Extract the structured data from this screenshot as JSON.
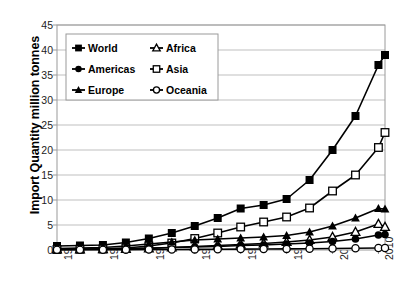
{
  "chart_data": {
    "type": "line",
    "title": "",
    "xlabel": "",
    "ylabel": "Import Quantity million tonnes",
    "xlim": [
      1961,
      2011
    ],
    "ylim": [
      0,
      45
    ],
    "ytick_labels": [
      "0",
      "5",
      "10",
      "15",
      "20",
      "25",
      "30",
      "35",
      "40",
      "45"
    ],
    "ytick_values": [
      0,
      5,
      10,
      15,
      20,
      25,
      30,
      35,
      40,
      45
    ],
    "xtick_labels": [
      "1961",
      "1968",
      "1975",
      "1982",
      "1989",
      "1996",
      "2003",
      "2010"
    ],
    "xtick_values": [
      1961,
      1968,
      1975,
      1982,
      1989,
      1996,
      2003,
      2010
    ],
    "grid": "horizontal",
    "legend_position": "top-left-inside",
    "x": [
      1961,
      1964.5,
      1968,
      1971.5,
      1975,
      1978.5,
      1982,
      1985.5,
      1989,
      1992.5,
      1996,
      1999.5,
      2003,
      2006.5,
      2010,
      2011
    ],
    "series": [
      {
        "name": "World",
        "marker": "filled-square",
        "values": [
          0.8,
          0.9,
          1.0,
          1.5,
          2.3,
          3.4,
          4.8,
          6.4,
          8.3,
          9.0,
          10.2,
          14.0,
          20.0,
          26.8,
          37.0,
          39.0
        ]
      },
      {
        "name": "Africa",
        "marker": "open-triangle",
        "values": [
          0.1,
          0.1,
          0.15,
          0.2,
          0.3,
          0.5,
          0.7,
          0.9,
          1.1,
          1.3,
          1.6,
          2.0,
          2.6,
          3.6,
          5.2,
          4.6
        ]
      },
      {
        "name": "Americas",
        "marker": "filled-circle",
        "values": [
          0.2,
          0.2,
          0.25,
          0.3,
          0.4,
          0.5,
          0.6,
          0.7,
          0.9,
          1.0,
          1.2,
          1.4,
          1.7,
          2.2,
          3.0,
          3.1
        ]
      },
      {
        "name": "Asia",
        "marker": "open-square",
        "values": [
          0.1,
          0.15,
          0.2,
          0.4,
          0.8,
          1.4,
          2.3,
          3.4,
          4.6,
          5.6,
          6.6,
          8.4,
          11.8,
          15.0,
          20.5,
          23.5
        ]
      },
      {
        "name": "Europe",
        "marker": "filled-triangle",
        "values": [
          0.3,
          0.4,
          0.5,
          0.8,
          1.2,
          1.6,
          2.0,
          2.2,
          2.4,
          2.6,
          2.9,
          3.6,
          4.8,
          6.4,
          8.3,
          8.2
        ]
      },
      {
        "name": "Oceania",
        "marker": "open-circle",
        "values": [
          0.05,
          0.05,
          0.05,
          0.07,
          0.1,
          0.1,
          0.12,
          0.15,
          0.18,
          0.2,
          0.22,
          0.25,
          0.3,
          0.35,
          0.4,
          0.4
        ]
      }
    ],
    "legend_entries": [
      {
        "label": "World",
        "marker": "filled-square"
      },
      {
        "label": "Africa",
        "marker": "open-triangle"
      },
      {
        "label": "Americas",
        "marker": "filled-circle"
      },
      {
        "label": "Asia",
        "marker": "open-square"
      },
      {
        "label": "Europe",
        "marker": "filled-triangle"
      },
      {
        "label": "Oceania",
        "marker": "open-circle"
      }
    ],
    "colors": {
      "line": "#000000",
      "grid": "#bfbfbf",
      "axis": "#808080",
      "background": "#ffffff",
      "text": "#000000"
    }
  }
}
